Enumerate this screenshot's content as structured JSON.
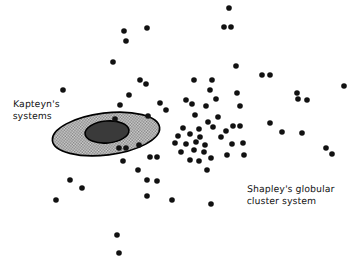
{
  "figure": {
    "title": "",
    "background_color": "#ffffff",
    "dot_color": "#111111",
    "outline_color": "#000000",
    "outer_ellipse_fill": "#b5b5b5",
    "inner_ellipse_fill": "#3a3a3a"
  },
  "labels": {
    "kapteyn": "Kapteyn's\nsystems",
    "shapley": "Shapley's globular\ncluster system"
  },
  "chart_data": {
    "type": "scatter",
    "title": "",
    "xlabel": "",
    "ylabel": "",
    "xlim": [
      0,
      360
    ],
    "ylim": [
      0,
      259
    ],
    "grid": false,
    "legend_position": "inline-annotations",
    "annotations": [
      {
        "text": "Kapteyn's systems",
        "x": 13,
        "y": 98
      },
      {
        "text": "Shapley's globular cluster system",
        "x": 247,
        "y": 183
      }
    ],
    "shapes": [
      {
        "name": "kapteyn-outer-ellipse",
        "type": "ellipse",
        "cx": 106,
        "cy": 134,
        "rx": 54,
        "ry": 21,
        "rotation": -7,
        "fill": "#b5b5b5",
        "fill_pattern": "cross-hatch",
        "stroke": "#000000"
      },
      {
        "name": "kapteyn-inner-ellipse",
        "type": "ellipse",
        "cx": 107,
        "cy": 132,
        "rx": 22,
        "ry": 11,
        "rotation": -5,
        "fill": "#3a3a3a",
        "stroke": "#000000"
      }
    ],
    "series": [
      {
        "name": "Shapley's globular cluster system",
        "marker": "filled-circle",
        "marker_radius": 2.8,
        "color": "#111111",
        "points": [
          [
            229,
            8
          ],
          [
            124,
            31
          ],
          [
            147,
            28
          ],
          [
            224,
            27
          ],
          [
            231,
            27
          ],
          [
            126,
            41
          ],
          [
            113,
            62
          ],
          [
            236,
            66
          ],
          [
            140,
            80
          ],
          [
            146,
            84
          ],
          [
            194,
            80
          ],
          [
            212,
            80
          ],
          [
            262,
            75
          ],
          [
            270,
            75
          ],
          [
            63,
            90
          ],
          [
            129,
            95
          ],
          [
            210,
            90
          ],
          [
            237,
            93
          ],
          [
            297,
            93
          ],
          [
            344,
            86
          ],
          [
            120,
            105
          ],
          [
            160,
            103
          ],
          [
            186,
            100
          ],
          [
            216,
            99
          ],
          [
            240,
            106
          ],
          [
            298,
            99
          ],
          [
            307,
            100
          ],
          [
            166,
            110
          ],
          [
            192,
            104
          ],
          [
            206,
            106
          ],
          [
            148,
            116
          ],
          [
            115,
            119
          ],
          [
            195,
            115
          ],
          [
            218,
            117
          ],
          [
            208,
            122
          ],
          [
            240,
            126
          ],
          [
            270,
            123
          ],
          [
            183,
            128
          ],
          [
            199,
            129
          ],
          [
            213,
            127
          ],
          [
            226,
            131
          ],
          [
            233,
            126
          ],
          [
            282,
            132
          ],
          [
            302,
            133
          ],
          [
            178,
            136
          ],
          [
            190,
            134
          ],
          [
            200,
            137
          ],
          [
            221,
            137
          ],
          [
            119,
            148
          ],
          [
            126,
            148
          ],
          [
            139,
            145
          ],
          [
            175,
            143
          ],
          [
            186,
            144
          ],
          [
            196,
            142
          ],
          [
            205,
            145
          ],
          [
            232,
            144
          ],
          [
            243,
            143
          ],
          [
            326,
            148
          ],
          [
            332,
            154
          ],
          [
            123,
            161
          ],
          [
            150,
            157
          ],
          [
            157,
            157
          ],
          [
            181,
            152
          ],
          [
            194,
            150
          ],
          [
            204,
            152
          ],
          [
            227,
            155
          ],
          [
            244,
            155
          ],
          [
            138,
            170
          ],
          [
            190,
            160
          ],
          [
            199,
            161
          ],
          [
            211,
            158
          ],
          [
            147,
            180
          ],
          [
            157,
            181
          ],
          [
            207,
            170
          ],
          [
            70,
            180
          ],
          [
            82,
            188
          ],
          [
            147,
            196
          ],
          [
            172,
            200
          ],
          [
            56,
            200
          ],
          [
            211,
            204
          ],
          [
            117,
            235
          ],
          [
            119,
            253
          ]
        ]
      },
      {
        "name": "Kapteyn's systems",
        "marker": "filled-circle",
        "marker_radius": 2.8,
        "color": "#111111",
        "points": [
          [
            115,
            119
          ],
          [
            119,
            148
          ],
          [
            126,
            148
          ],
          [
            139,
            145
          ]
        ]
      }
    ]
  }
}
